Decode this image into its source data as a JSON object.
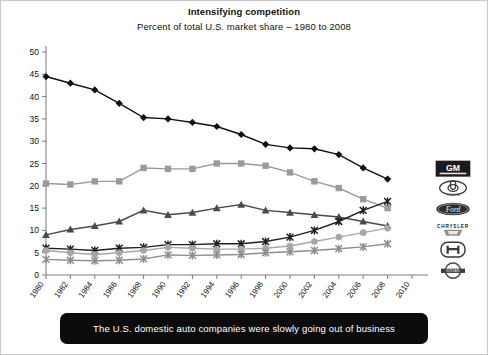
{
  "chart_data": {
    "type": "line",
    "title": "Intensifying competition",
    "subtitle": "Percent of total U.S. market share – 1980 to 2008",
    "xlabel": "",
    "ylabel": "",
    "xlim": [
      1980,
      2010
    ],
    "ylim": [
      0,
      50
    ],
    "ytick_step": 5,
    "xtick_step": 2,
    "grid": false,
    "legend_position": "right",
    "yticks": [
      0,
      5,
      10,
      15,
      20,
      25,
      30,
      35,
      40,
      45,
      50
    ],
    "categories": [
      1980,
      1982,
      1984,
      1986,
      1988,
      1990,
      1992,
      1994,
      1996,
      1998,
      2000,
      2002,
      2004,
      2006,
      2008
    ],
    "xticks": [
      1980,
      1982,
      1984,
      1986,
      1988,
      1990,
      1992,
      1994,
      1996,
      1998,
      2000,
      2002,
      2004,
      2006,
      2008,
      2010
    ],
    "series": [
      {
        "name": "GM",
        "marker": "diamond",
        "color": "#111111",
        "values": [
          44.5,
          43.0,
          41.5,
          38.5,
          35.3,
          35.0,
          34.2,
          33.3,
          31.5,
          29.3,
          28.5,
          28.3,
          27.0,
          24.0,
          21.5
        ]
      },
      {
        "name": "Ford",
        "marker": "square",
        "color": "#9a9a9a",
        "values": [
          20.5,
          20.3,
          21.0,
          21.0,
          24.0,
          23.8,
          23.8,
          25.0,
          25.0,
          24.5,
          23.0,
          21.0,
          19.5,
          17.0,
          15.0
        ]
      },
      {
        "name": "Chrysler",
        "marker": "triangle",
        "color": "#4a4a4a",
        "values": [
          9.0,
          10.2,
          11.0,
          12.0,
          14.5,
          13.5,
          14.0,
          15.0,
          15.8,
          14.5,
          14.0,
          13.5,
          13.0,
          12.0,
          11.0
        ]
      },
      {
        "name": "Toyota",
        "marker": "cross",
        "color": "#1f1f1f",
        "values": [
          6.0,
          5.8,
          5.5,
          6.0,
          6.2,
          6.8,
          6.8,
          7.0,
          7.0,
          7.5,
          8.5,
          10.0,
          12.0,
          14.5,
          16.5
        ]
      },
      {
        "name": "Honda",
        "marker": "circle",
        "color": "#a8a8a8",
        "values": [
          5.5,
          5.0,
          4.6,
          5.0,
          5.5,
          6.2,
          6.0,
          5.8,
          5.8,
          6.0,
          6.5,
          7.5,
          8.5,
          9.5,
          10.5
        ]
      },
      {
        "name": "Nissan",
        "marker": "cross",
        "color": "#8e8e8e",
        "values": [
          3.5,
          3.3,
          3.2,
          3.3,
          3.6,
          4.5,
          4.4,
          4.5,
          4.6,
          5.0,
          5.2,
          5.5,
          5.9,
          6.3,
          7.0
        ]
      }
    ],
    "legend_logos": [
      {
        "name": "GM",
        "label": "GM"
      },
      {
        "name": "Toyota",
        "label": "TOYOTA"
      },
      {
        "name": "Ford",
        "label": "Ford"
      },
      {
        "name": "Chrysler",
        "label": "CHRYSLER"
      },
      {
        "name": "Honda",
        "label": "H"
      },
      {
        "name": "Nissan",
        "label": "NISSAN"
      }
    ]
  },
  "caption": {
    "text": "The U.S. domestic auto companies were slowly going out of business"
  }
}
